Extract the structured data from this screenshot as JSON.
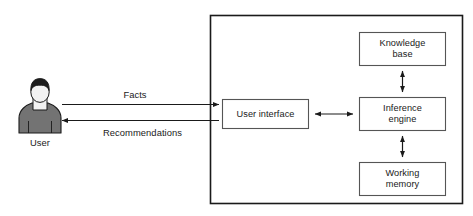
{
  "diagram": {
    "actor": {
      "name": "user-actor",
      "label": "User",
      "icon": "person-icon",
      "colors": {
        "hair": "#1c1c1c",
        "face": "#f2f2f2",
        "body": "#737373",
        "outline": "#1a1a1a"
      }
    },
    "flows": [
      {
        "name": "facts-flow",
        "label": "Facts",
        "direction": "user-to-system"
      },
      {
        "name": "recommendations-flow",
        "label": "Recommendations",
        "direction": "system-to-user"
      }
    ],
    "system_boundary": {
      "name": "expert-system-boundary",
      "border_color": "#1a1a1a"
    },
    "components": [
      {
        "name": "user-interface-box",
        "label": "User interface"
      },
      {
        "name": "knowledge-base-box",
        "label": "Knowledge\nbase"
      },
      {
        "name": "inference-engine-box",
        "label": "Inference\nengine"
      },
      {
        "name": "working-memory-box",
        "label": "Working\nmemory"
      }
    ],
    "connectors": [
      {
        "name": "ui-inference-connector",
        "style": "double-arrow",
        "orientation": "horizontal"
      },
      {
        "name": "knowledge-inference-connector",
        "style": "double-arrow",
        "orientation": "vertical"
      },
      {
        "name": "working-inference-connector",
        "style": "double-arrow",
        "orientation": "vertical"
      }
    ],
    "colors": {
      "line": "#1a1a1a",
      "box_border": "#555555",
      "background": "#ffffff",
      "text": "#1a1a1a"
    }
  }
}
